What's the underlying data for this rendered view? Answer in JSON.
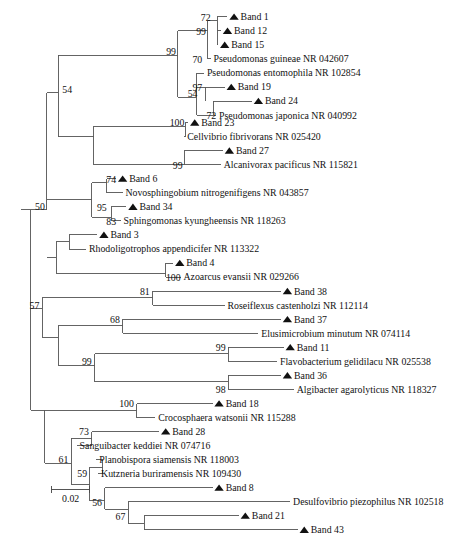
{
  "figure": {
    "type": "phylogenetic-tree",
    "title": "",
    "marker_symbol": "filled-triangle",
    "marker_meaning": "Band (DGGE band sequence)",
    "line_color": "#5a5a5a",
    "text_color": "#111111",
    "background": "#ffffff"
  },
  "scale_bar": {
    "label": "0.02",
    "x_start": 55,
    "x_end": 96,
    "y": 523
  },
  "taxa": [
    {
      "id": "t1",
      "label": "Band 1",
      "marker": true,
      "y": 18,
      "tip_x": 243
    },
    {
      "id": "t2",
      "label": "Band 12",
      "marker": true,
      "y": 33,
      "tip_x": 236
    },
    {
      "id": "t3",
      "label": "Band 15",
      "marker": true,
      "y": 48,
      "tip_x": 233
    },
    {
      "id": "t4",
      "label": "Pseudomonas guineae NR 042607",
      "marker": false,
      "y": 63,
      "tip_x": 225
    },
    {
      "id": "t5",
      "label": "Pseudomonas entomophila NR 102854",
      "marker": false,
      "y": 78,
      "tip_x": 218
    },
    {
      "id": "t6",
      "label": "Band 19",
      "marker": true,
      "y": 93,
      "tip_x": 240
    },
    {
      "id": "t7",
      "label": "Band 24",
      "marker": true,
      "y": 108,
      "tip_x": 269
    },
    {
      "id": "t8",
      "label": "Pseudomonas japonica NR 040992",
      "marker": false,
      "y": 123,
      "tip_x": 231
    },
    {
      "id": "t9",
      "label": "Band 23",
      "marker": true,
      "y": 131,
      "tip_x": 201
    },
    {
      "id": "t10",
      "label": "Cellvibrio fibrivorans NR 025420",
      "marker": false,
      "y": 146,
      "tip_x": 197
    },
    {
      "id": "t11",
      "label": "Band 27",
      "marker": true,
      "y": 161,
      "tip_x": 238
    },
    {
      "id": "t12",
      "label": "Alcanivorax pacificus NR 115821",
      "marker": false,
      "y": 176,
      "tip_x": 236
    },
    {
      "id": "t13",
      "label": "Band 6",
      "marker": true,
      "y": 191,
      "tip_x": 124
    },
    {
      "id": "t14",
      "label": "Novosphingobium nitrogenifigens NR 043857",
      "marker": false,
      "y": 206,
      "tip_x": 131
    },
    {
      "id": "t15",
      "label": "Band 34",
      "marker": true,
      "y": 221,
      "tip_x": 135
    },
    {
      "id": "t16",
      "label": "Sphingomonas kyungheensis NR 118263",
      "marker": false,
      "y": 236,
      "tip_x": 129
    },
    {
      "id": "t17",
      "label": "Band 3",
      "marker": true,
      "y": 251,
      "tip_x": 104
    },
    {
      "id": "t18",
      "label": "Rhodoligotrophos appendicifer NR 113322",
      "marker": false,
      "y": 266,
      "tip_x": 92
    },
    {
      "id": "t19",
      "label": "Band 4",
      "marker": true,
      "y": 281,
      "tip_x": 185
    },
    {
      "id": "t20",
      "label": "Azoarcus evansii NR 029266",
      "marker": false,
      "y": 296,
      "tip_x": 193
    },
    {
      "id": "t21",
      "label": "Band 38",
      "marker": true,
      "y": 311,
      "tip_x": 300
    },
    {
      "id": "t22",
      "label": "Roseiflexus castenholzi NR 112114",
      "marker": false,
      "y": 326,
      "tip_x": 240
    },
    {
      "id": "t23",
      "label": "Band 37",
      "marker": true,
      "y": 341,
      "tip_x": 300
    },
    {
      "id": "t24",
      "label": "Elusimicrobium minutum NR 074114",
      "marker": false,
      "y": 356,
      "tip_x": 276
    },
    {
      "id": "t25",
      "label": "Band 11",
      "marker": true,
      "y": 371,
      "tip_x": 303
    },
    {
      "id": "t26",
      "label": "Flavobacterium gelidilacu NR 025538",
      "marker": false,
      "y": 386,
      "tip_x": 296
    },
    {
      "id": "t27",
      "label": "Band 36",
      "marker": true,
      "y": 401,
      "tip_x": 300
    },
    {
      "id": "t28",
      "label": "Algibacter agarolyticus NR 118327",
      "marker": false,
      "y": 416,
      "tip_x": 314
    },
    {
      "id": "t29",
      "label": "Band 18",
      "marker": true,
      "y": 431,
      "tip_x": 227
    },
    {
      "id": "t30",
      "label": "Crocosphaera watsonii NR 115288",
      "marker": false,
      "y": 446,
      "tip_x": 166
    },
    {
      "id": "t31",
      "label": "Band 28",
      "marker": true,
      "y": 461,
      "tip_x": 170
    },
    {
      "id": "t32",
      "label": "Sanguibacter keddiei NR 074716",
      "marker": false,
      "y": 476,
      "tip_x": 82
    },
    {
      "id": "t33",
      "label": "Planobispora siamensis NR 118003",
      "marker": false,
      "y": 491,
      "tip_x": 103
    },
    {
      "id": "t34",
      "label": "Kutzneria buriramensis NR 109430",
      "marker": false,
      "y": 506,
      "tip_x": 105
    },
    {
      "id": "t35",
      "label": "Band 8",
      "marker": true,
      "y": 521,
      "tip_x": 227
    },
    {
      "id": "t36",
      "label": "Desulfovibrio piezophilus NR 102518",
      "marker": false,
      "y": 536,
      "tip_x": 310
    },
    {
      "id": "t37",
      "label": "Band 21",
      "marker": true,
      "y": 551,
      "tip_x": 255
    },
    {
      "id": "t38",
      "label": "Band 43",
      "marker": true,
      "y": 566,
      "tip_x": 318
    }
  ],
  "bootstrap_values": [
    {
      "id": "b1",
      "value": "72",
      "x": 225,
      "y": 22
    },
    {
      "id": "b2",
      "value": "99",
      "x": 220,
      "y": 37
    },
    {
      "id": "b3",
      "value": "70",
      "x": 216,
      "y": 67
    },
    {
      "id": "b4",
      "value": "99",
      "x": 188,
      "y": 59
    },
    {
      "id": "b5",
      "value": "97",
      "x": 216,
      "y": 97
    },
    {
      "id": "b6",
      "value": "54",
      "x": 211,
      "y": 104
    },
    {
      "id": "b7",
      "value": "72",
      "x": 231,
      "y": 127
    },
    {
      "id": "b8",
      "value": "54",
      "x": 77,
      "y": 99
    },
    {
      "id": "b9",
      "value": "100",
      "x": 197,
      "y": 135
    },
    {
      "id": "b10",
      "value": "99",
      "x": 195,
      "y": 180
    },
    {
      "id": "b11",
      "value": "74",
      "x": 124,
      "y": 195
    },
    {
      "id": "b12",
      "value": "95",
      "x": 114,
      "y": 225
    },
    {
      "id": "b13",
      "value": "83",
      "x": 124,
      "y": 240
    },
    {
      "id": "b14",
      "value": "50",
      "x": 48,
      "y": 224
    },
    {
      "id": "b15",
      "value": "100",
      "x": 193,
      "y": 300
    },
    {
      "id": "b16",
      "value": "81",
      "x": 160,
      "y": 315
    },
    {
      "id": "b17",
      "value": "68",
      "x": 128,
      "y": 345
    },
    {
      "id": "b18",
      "value": "57",
      "x": 42,
      "y": 330
    },
    {
      "id": "b19",
      "value": "99",
      "x": 241,
      "y": 375
    },
    {
      "id": "b20",
      "value": "99",
      "x": 98,
      "y": 390
    },
    {
      "id": "b21",
      "value": "98",
      "x": 241,
      "y": 420
    },
    {
      "id": "b22",
      "value": "100",
      "x": 143,
      "y": 435
    },
    {
      "id": "b23",
      "value": "73",
      "x": 95,
      "y": 465
    },
    {
      "id": "b24",
      "value": "61",
      "x": 73,
      "y": 495
    },
    {
      "id": "b25",
      "value": "59",
      "x": 93,
      "y": 510
    },
    {
      "id": "b26",
      "value": "56",
      "x": 109,
      "y": 540
    },
    {
      "id": "b27",
      "value": "67",
      "x": 134,
      "y": 555
    }
  ],
  "branches": [
    {
      "id": "br-root-h",
      "x1": 22,
      "y1": 224,
      "x2": 33,
      "y2": 224
    },
    {
      "id": "br-root-v",
      "x1": 33,
      "y1": 224,
      "x2": 33,
      "y2": 438
    },
    {
      "id": "br-a-v",
      "x1": 50,
      "y1": 99,
      "x2": 50,
      "y2": 224
    },
    {
      "id": "br-a-stem",
      "x1": 33,
      "y1": 224,
      "x2": 50,
      "y2": 224
    },
    {
      "id": "br-54-h",
      "x1": 50,
      "y1": 99,
      "x2": 62,
      "y2": 99
    },
    {
      "id": "br-54-v",
      "x1": 62,
      "y1": 59,
      "x2": 62,
      "y2": 146
    },
    {
      "id": "br-99top-h",
      "x1": 62,
      "y1": 59,
      "x2": 190,
      "y2": 59
    },
    {
      "id": "br-99top-v",
      "x1": 190,
      "y1": 33,
      "x2": 190,
      "y2": 104
    },
    {
      "id": "br-99b-h",
      "x1": 190,
      "y1": 33,
      "x2": 222,
      "y2": 33
    },
    {
      "id": "br-99b-v",
      "x1": 222,
      "y1": 22,
      "x2": 222,
      "y2": 63
    },
    {
      "id": "br-72-h",
      "x1": 222,
      "y1": 22,
      "x2": 232,
      "y2": 22
    },
    {
      "id": "br-72-v",
      "x1": 232,
      "y1": 18,
      "x2": 232,
      "y2": 48
    },
    {
      "id": "br-t1",
      "x1": 232,
      "y1": 18,
      "x2": 243,
      "y2": 18
    },
    {
      "id": "br-t2",
      "x1": 232,
      "y1": 33,
      "x2": 236,
      "y2": 33
    },
    {
      "id": "br-t3",
      "x1": 232,
      "y1": 48,
      "x2": 233,
      "y2": 48
    },
    {
      "id": "br-t4",
      "x1": 222,
      "y1": 63,
      "x2": 225,
      "y2": 63
    },
    {
      "id": "br-97grp-h",
      "x1": 190,
      "y1": 104,
      "x2": 210,
      "y2": 104
    },
    {
      "id": "br-97grp-v",
      "x1": 210,
      "y1": 78,
      "x2": 210,
      "y2": 123
    },
    {
      "id": "br-t5",
      "x1": 210,
      "y1": 78,
      "x2": 218,
      "y2": 78
    },
    {
      "id": "br-97-h",
      "x1": 210,
      "y1": 93,
      "x2": 220,
      "y2": 93
    },
    {
      "id": "br-t6",
      "x1": 220,
      "y1": 93,
      "x2": 240,
      "y2": 93
    },
    {
      "id": "br-54b-v",
      "x1": 220,
      "y1": 93,
      "x2": 220,
      "y2": 108
    },
    {
      "id": "br-jap-h",
      "x1": 210,
      "y1": 123,
      "x2": 228,
      "y2": 123
    },
    {
      "id": "br-jap-v",
      "x1": 228,
      "y1": 108,
      "x2": 228,
      "y2": 123
    },
    {
      "id": "br-t7",
      "x1": 228,
      "y1": 108,
      "x2": 269,
      "y2": 108
    },
    {
      "id": "br-t8",
      "x1": 228,
      "y1": 123,
      "x2": 231,
      "y2": 123
    },
    {
      "id": "br-cell-h",
      "x1": 62,
      "y1": 146,
      "x2": 100,
      "y2": 146
    },
    {
      "id": "br-cell-v",
      "x1": 100,
      "y1": 135,
      "x2": 100,
      "y2": 176
    },
    {
      "id": "br-100a-h",
      "x1": 100,
      "y1": 135,
      "x2": 198,
      "y2": 135
    },
    {
      "id": "br-100a-v",
      "x1": 198,
      "y1": 131,
      "x2": 198,
      "y2": 146
    },
    {
      "id": "br-t9",
      "x1": 198,
      "y1": 131,
      "x2": 201,
      "y2": 131
    },
    {
      "id": "br-t10",
      "x1": 198,
      "y1": 146,
      "x2": 197,
      "y2": 146
    },
    {
      "id": "br-99c-h",
      "x1": 100,
      "y1": 176,
      "x2": 197,
      "y2": 176
    },
    {
      "id": "br-99c-v",
      "x1": 197,
      "y1": 161,
      "x2": 197,
      "y2": 176
    },
    {
      "id": "br-t11",
      "x1": 197,
      "y1": 161,
      "x2": 238,
      "y2": 161
    },
    {
      "id": "br-t12",
      "x1": 197,
      "y1": 176,
      "x2": 236,
      "y2": 176
    },
    {
      "id": "br-sph-h",
      "x1": 50,
      "y1": 213,
      "x2": 98,
      "y2": 213
    },
    {
      "id": "br-sph-v",
      "x1": 98,
      "y1": 195,
      "x2": 98,
      "y2": 232
    },
    {
      "id": "br-74-h",
      "x1": 98,
      "y1": 195,
      "x2": 114,
      "y2": 195
    },
    {
      "id": "br-74-v",
      "x1": 114,
      "y1": 191,
      "x2": 114,
      "y2": 206
    },
    {
      "id": "br-t13",
      "x1": 114,
      "y1": 191,
      "x2": 124,
      "y2": 191
    },
    {
      "id": "br-t14",
      "x1": 114,
      "y1": 206,
      "x2": 131,
      "y2": 206
    },
    {
      "id": "br-83-h",
      "x1": 98,
      "y1": 232,
      "x2": 119,
      "y2": 232
    },
    {
      "id": "br-83-v",
      "x1": 119,
      "y1": 221,
      "x2": 119,
      "y2": 236
    },
    {
      "id": "br-t15",
      "x1": 119,
      "y1": 221,
      "x2": 135,
      "y2": 221
    },
    {
      "id": "br-t16",
      "x1": 119,
      "y1": 236,
      "x2": 129,
      "y2": 236
    },
    {
      "id": "br-rho-h",
      "x1": 50,
      "y1": 275,
      "x2": 60,
      "y2": 275
    },
    {
      "id": "br-rho-v",
      "x1": 60,
      "y1": 258,
      "x2": 60,
      "y2": 292
    },
    {
      "id": "br-rhoA-h",
      "x1": 60,
      "y1": 258,
      "x2": 74,
      "y2": 258
    },
    {
      "id": "br-rhoA-v",
      "x1": 74,
      "y1": 251,
      "x2": 74,
      "y2": 266
    },
    {
      "id": "br-t17",
      "x1": 74,
      "y1": 251,
      "x2": 104,
      "y2": 251
    },
    {
      "id": "br-t18",
      "x1": 74,
      "y1": 266,
      "x2": 92,
      "y2": 266
    },
    {
      "id": "br-azo-h",
      "x1": 60,
      "y1": 292,
      "x2": 177,
      "y2": 292
    },
    {
      "id": "br-azo-v",
      "x1": 177,
      "y1": 281,
      "x2": 177,
      "y2": 296
    },
    {
      "id": "br-t19",
      "x1": 177,
      "y1": 281,
      "x2": 185,
      "y2": 281
    },
    {
      "id": "br-t20",
      "x1": 177,
      "y1": 296,
      "x2": 193,
      "y2": 296
    },
    {
      "id": "br-57-stem",
      "x1": 33,
      "y1": 330,
      "x2": 45,
      "y2": 330
    },
    {
      "id": "br-57-v",
      "x1": 45,
      "y1": 318,
      "x2": 45,
      "y2": 360
    },
    {
      "id": "br-81-h",
      "x1": 45,
      "y1": 318,
      "x2": 163,
      "y2": 318
    },
    {
      "id": "br-81-v",
      "x1": 163,
      "y1": 311,
      "x2": 163,
      "y2": 326
    },
    {
      "id": "br-t21",
      "x1": 163,
      "y1": 311,
      "x2": 300,
      "y2": 311
    },
    {
      "id": "br-t22",
      "x1": 163,
      "y1": 326,
      "x2": 240,
      "y2": 326
    },
    {
      "id": "br-lw-h",
      "x1": 45,
      "y1": 360,
      "x2": 62,
      "y2": 360
    },
    {
      "id": "br-lw-v",
      "x1": 62,
      "y1": 348,
      "x2": 62,
      "y2": 390
    },
    {
      "id": "br-68-h",
      "x1": 62,
      "y1": 348,
      "x2": 131,
      "y2": 348
    },
    {
      "id": "br-68-v",
      "x1": 131,
      "y1": 341,
      "x2": 131,
      "y2": 356
    },
    {
      "id": "br-t23",
      "x1": 131,
      "y1": 341,
      "x2": 300,
      "y2": 341
    },
    {
      "id": "br-t24",
      "x1": 131,
      "y1": 356,
      "x2": 276,
      "y2": 356
    },
    {
      "id": "br-99d-h",
      "x1": 62,
      "y1": 390,
      "x2": 101,
      "y2": 390
    },
    {
      "id": "br-99d-v",
      "x1": 101,
      "y1": 378,
      "x2": 101,
      "y2": 408
    },
    {
      "id": "br-99e-h",
      "x1": 101,
      "y1": 378,
      "x2": 244,
      "y2": 378
    },
    {
      "id": "br-99e-v",
      "x1": 244,
      "y1": 371,
      "x2": 244,
      "y2": 386
    },
    {
      "id": "br-t25",
      "x1": 244,
      "y1": 371,
      "x2": 303,
      "y2": 371
    },
    {
      "id": "br-t26",
      "x1": 244,
      "y1": 386,
      "x2": 296,
      "y2": 386
    },
    {
      "id": "br-98-h",
      "x1": 101,
      "y1": 408,
      "x2": 244,
      "y2": 408
    },
    {
      "id": "br-98-v",
      "x1": 244,
      "y1": 401,
      "x2": 244,
      "y2": 416
    },
    {
      "id": "br-t27",
      "x1": 244,
      "y1": 401,
      "x2": 300,
      "y2": 401
    },
    {
      "id": "br-t28",
      "x1": 244,
      "y1": 416,
      "x2": 314,
      "y2": 416
    },
    {
      "id": "br-bot-stem",
      "x1": 33,
      "y1": 438,
      "x2": 48,
      "y2": 438
    },
    {
      "id": "br-bot-v",
      "x1": 48,
      "y1": 438,
      "x2": 48,
      "y2": 495
    },
    {
      "id": "br-100b-h",
      "x1": 48,
      "y1": 438,
      "x2": 146,
      "y2": 438
    },
    {
      "id": "br-100b-v",
      "x1": 146,
      "y1": 431,
      "x2": 146,
      "y2": 446
    },
    {
      "id": "br-t29",
      "x1": 146,
      "y1": 431,
      "x2": 227,
      "y2": 431
    },
    {
      "id": "br-t30",
      "x1": 146,
      "y1": 446,
      "x2": 166,
      "y2": 446
    },
    {
      "id": "br-61-h",
      "x1": 48,
      "y1": 495,
      "x2": 76,
      "y2": 495
    },
    {
      "id": "br-61-v",
      "x1": 76,
      "y1": 468,
      "x2": 76,
      "y2": 517
    },
    {
      "id": "br-73-h",
      "x1": 76,
      "y1": 468,
      "x2": 98,
      "y2": 468
    },
    {
      "id": "br-73-v",
      "x1": 98,
      "y1": 461,
      "x2": 98,
      "y2": 476
    },
    {
      "id": "br-t31",
      "x1": 98,
      "y1": 461,
      "x2": 170,
      "y2": 461
    },
    {
      "id": "br-t32",
      "x1": 98,
      "y1": 476,
      "x2": 82,
      "y2": 476
    },
    {
      "id": "br-59-h",
      "x1": 76,
      "y1": 517,
      "x2": 96,
      "y2": 517
    },
    {
      "id": "br-59-v",
      "x1": 96,
      "y1": 499,
      "x2": 96,
      "y2": 535
    },
    {
      "id": "br-plk-h",
      "x1": 96,
      "y1": 499,
      "x2": 110,
      "y2": 499
    },
    {
      "id": "br-plk-v",
      "x1": 110,
      "y1": 491,
      "x2": 110,
      "y2": 506
    },
    {
      "id": "br-t33",
      "x1": 110,
      "y1": 491,
      "x2": 103,
      "y2": 491
    },
    {
      "id": "br-t34",
      "x1": 110,
      "y1": 506,
      "x2": 105,
      "y2": 506
    },
    {
      "id": "br-dsv-h",
      "x1": 96,
      "y1": 535,
      "x2": 112,
      "y2": 535
    },
    {
      "id": "br-dsv-v",
      "x1": 112,
      "y1": 521,
      "x2": 112,
      "y2": 544
    },
    {
      "id": "br-t35",
      "x1": 112,
      "y1": 521,
      "x2": 227,
      "y2": 521
    },
    {
      "id": "br-56-h",
      "x1": 112,
      "y1": 544,
      "x2": 137,
      "y2": 544
    },
    {
      "id": "br-56-v",
      "x1": 137,
      "y1": 536,
      "x2": 137,
      "y2": 559
    },
    {
      "id": "br-t36",
      "x1": 137,
      "y1": 536,
      "x2": 310,
      "y2": 536
    },
    {
      "id": "br-67-h",
      "x1": 137,
      "y1": 559,
      "x2": 154,
      "y2": 559
    },
    {
      "id": "br-67-v",
      "x1": 154,
      "y1": 551,
      "x2": 154,
      "y2": 566
    },
    {
      "id": "br-t37",
      "x1": 154,
      "y1": 551,
      "x2": 255,
      "y2": 551
    },
    {
      "id": "br-t38",
      "x1": 154,
      "y1": 566,
      "x2": 318,
      "y2": 566
    }
  ]
}
